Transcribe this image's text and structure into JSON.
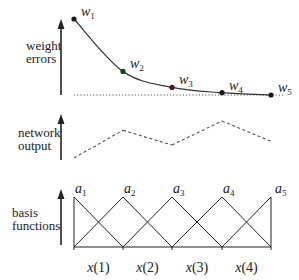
{
  "diagram": {
    "panels": [
      {
        "id": "weight-errors",
        "label_lines": [
          "weight",
          "errors"
        ],
        "points": [
          {
            "name": "w",
            "index": "1",
            "value": 1.0,
            "color": "#1a1a1a"
          },
          {
            "name": "w",
            "index": "2",
            "value": 0.31,
            "color": "#1a3d1a"
          },
          {
            "name": "w",
            "index": "3",
            "value": 0.1,
            "color": "#4a1a1a"
          },
          {
            "name": "w",
            "index": "4",
            "value": 0.03,
            "color": "#1a1a1a"
          },
          {
            "name": "w",
            "index": "5",
            "value": 0.0,
            "color": "#1a1a1a"
          }
        ],
        "baseline_style": "dotted"
      },
      {
        "id": "network-output",
        "label_lines": [
          "network",
          "output"
        ],
        "values": [
          0.0,
          0.75,
          0.35,
          1.0,
          0.45
        ],
        "line_style": "dashed"
      },
      {
        "id": "basis-functions",
        "label_lines": [
          "basis",
          "functions"
        ],
        "functions": [
          {
            "name": "a",
            "index": "1"
          },
          {
            "name": "a",
            "index": "2"
          },
          {
            "name": "a",
            "index": "3"
          },
          {
            "name": "a",
            "index": "4"
          },
          {
            "name": "a",
            "index": "5"
          }
        ],
        "x_labels": [
          "x(1)",
          "x(2)",
          "x(3)",
          "x(4)"
        ]
      }
    ],
    "colors": {
      "ink": "#222222",
      "curve": "#333333",
      "dash": "#555555"
    }
  }
}
